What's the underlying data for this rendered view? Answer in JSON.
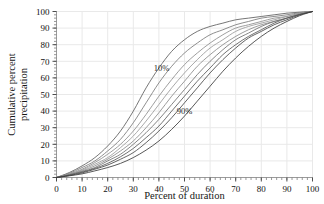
{
  "chart_data": {
    "type": "line",
    "title": "",
    "xlabel": "Percent of duration",
    "ylabel": "Cumulative percent precipitation",
    "xlim": [
      0,
      100
    ],
    "ylim": [
      0,
      100
    ],
    "xticks": [
      0,
      10,
      20,
      30,
      40,
      50,
      60,
      70,
      80,
      90,
      100
    ],
    "yticks": [
      0,
      10,
      20,
      30,
      40,
      50,
      60,
      70,
      80,
      90,
      100
    ],
    "xtick_labels": [
      "0",
      "10",
      "20",
      "30",
      "40",
      "50",
      "60",
      "70",
      "80",
      "90",
      "100"
    ],
    "ytick_labels": [
      "0",
      "10",
      "20",
      "30",
      "40",
      "50",
      "60",
      "70",
      "80",
      "90",
      "100"
    ],
    "grid": true,
    "grid_color": "#e9e9e9",
    "legend": "none",
    "minor_tick_step_x": 2,
    "minor_tick_step_y": 2,
    "annotations": [
      {
        "label": "10%",
        "x": 41,
        "y": 66
      },
      {
        "label": "90%",
        "x": 50,
        "y": 40
      }
    ],
    "x": [
      0,
      5,
      10,
      15,
      20,
      25,
      30,
      35,
      40,
      45,
      50,
      55,
      60,
      65,
      70,
      75,
      80,
      85,
      90,
      95,
      100
    ],
    "series": [
      {
        "name": "10%",
        "color": "#5d5d5d",
        "values": [
          0,
          3,
          7,
          12,
          19,
          28,
          40,
          54,
          66,
          76,
          83,
          88,
          91,
          93,
          95,
          96,
          97,
          98,
          99,
          99.6,
          100
        ]
      },
      {
        "name": "20%",
        "color": "#7a7a7a",
        "values": [
          0,
          2.5,
          6,
          10,
          16,
          23,
          33,
          45,
          57,
          67,
          75,
          81,
          86,
          89,
          92,
          94,
          96,
          97,
          98,
          99.3,
          100
        ]
      },
      {
        "name": "30%",
        "color": "#8d8d8d",
        "values": [
          0,
          2.2,
          5,
          9,
          14,
          20,
          28,
          38,
          49,
          59,
          68,
          75,
          81,
          86,
          90,
          92,
          94,
          96,
          97,
          99,
          100
        ]
      },
      {
        "name": "40%",
        "color": "#9a9a9a",
        "values": [
          0,
          2,
          4.5,
          8,
          12,
          18,
          25,
          34,
          44,
          54,
          63,
          71,
          78,
          83,
          88,
          91,
          93,
          95,
          97,
          98.8,
          100
        ]
      },
      {
        "name": "50%",
        "color": "#8a8a8a",
        "values": [
          0,
          1.8,
          4,
          7,
          11,
          16,
          22,
          30,
          39,
          49,
          58,
          67,
          74,
          80,
          85,
          89,
          92,
          94,
          96,
          98.5,
          100
        ]
      },
      {
        "name": "60%",
        "color": "#6f6f6f",
        "values": [
          0,
          1.6,
          3.6,
          6,
          10,
          14,
          20,
          27,
          35,
          44,
          53,
          62,
          70,
          77,
          83,
          87,
          91,
          94,
          96,
          98.3,
          100
        ]
      },
      {
        "name": "70%",
        "color": "#575757",
        "values": [
          0,
          1.4,
          3.2,
          5.5,
          8.5,
          12.5,
          17.5,
          24,
          31,
          40,
          49,
          58,
          66,
          74,
          80,
          85,
          89,
          93,
          96,
          98.2,
          100
        ]
      },
      {
        "name": "80%",
        "color": "#474747",
        "values": [
          0,
          1.2,
          2.8,
          5,
          7.5,
          11,
          15,
          21,
          28,
          36,
          45,
          54,
          63,
          71,
          78,
          84,
          88,
          92,
          95,
          98,
          100
        ]
      },
      {
        "name": "90%",
        "color": "#3a3a3a",
        "values": [
          0,
          1,
          2.2,
          4,
          6,
          8.5,
          12,
          16.5,
          22,
          29,
          37,
          46,
          55,
          64,
          72,
          79,
          85,
          90,
          94,
          97.5,
          100
        ]
      }
    ]
  }
}
